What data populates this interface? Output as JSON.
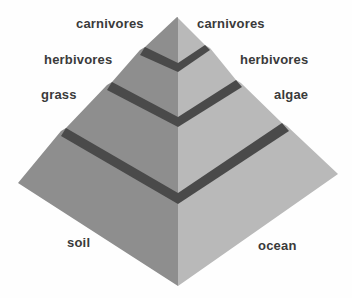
{
  "diagram": {
    "type": "food-pyramid",
    "colors": {
      "background": "#fefefe",
      "left_face": "#8e8e8e",
      "right_face": "#b9b9b9",
      "band": "#4a4a4a",
      "text": "#3a3a3a"
    },
    "left_side": {
      "title": "land food chain",
      "levels": [
        {
          "label": "carnivores"
        },
        {
          "label": "herbivores"
        },
        {
          "label": "grass"
        },
        {
          "label": "soil"
        }
      ]
    },
    "right_side": {
      "title": "ocean food chain",
      "levels": [
        {
          "label": "carnivores"
        },
        {
          "label": "herbivores"
        },
        {
          "label": "algae"
        },
        {
          "label": "ocean"
        }
      ]
    }
  }
}
